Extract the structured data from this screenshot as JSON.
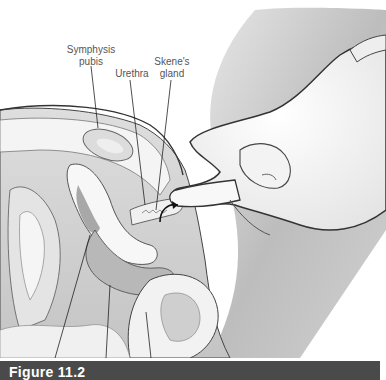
{
  "figure": {
    "caption": "Figure 11.2",
    "labels": {
      "symphysis_pubis": "Symphysis pubis",
      "symphysis_line1": "Symphysis",
      "symphysis_line2": "pubis",
      "urethra": "Urethra",
      "skenes_line1": "Skene's",
      "skenes_line2": "gland"
    },
    "colors": {
      "caption_bg": "#4a4a4a",
      "caption_text": "#ffffff",
      "label_text": "#555555",
      "tissue_light": "#f2f2f2",
      "tissue_mid": "#c8c8c8",
      "tissue_dark": "#9a9a9a",
      "outline": "#333333"
    }
  }
}
